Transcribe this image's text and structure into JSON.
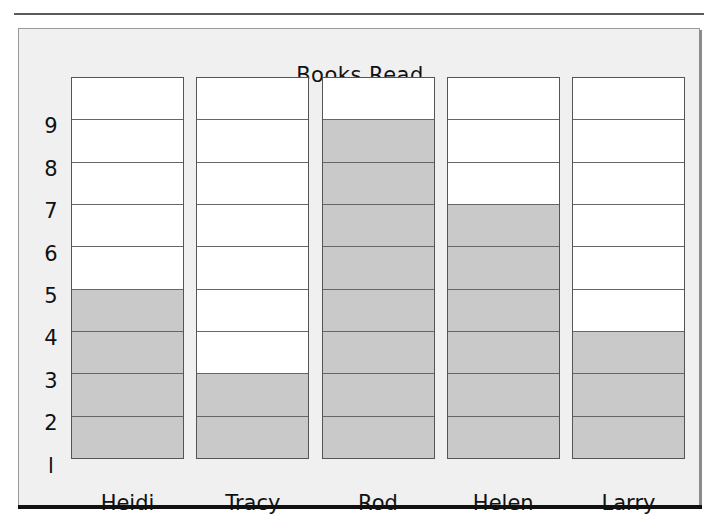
{
  "chart_data": {
    "type": "bar",
    "title": "Books Read",
    "subtitle": "",
    "xlabel": "",
    "ylabel": "",
    "categories": [
      "Heidi",
      "Tracy",
      "Rod",
      "Helen",
      "Larry"
    ],
    "values": [
      4,
      2,
      8,
      6,
      3
    ],
    "series": [
      {
        "name": "Books Read",
        "values": [
          4,
          2,
          8,
          6,
          3
        ]
      }
    ],
    "ylim": [
      0,
      9
    ],
    "ytick_labels": [
      "9",
      "8",
      "7",
      "6",
      "5",
      "4",
      "3",
      "2",
      "l"
    ],
    "ytick_values": [
      9,
      8,
      7,
      6,
      5,
      4,
      3,
      2,
      1
    ],
    "grid": true,
    "legend": false,
    "legend_position": "none",
    "style": "stacked-cell pictograph column chart",
    "filled_color": "#c9c9c9",
    "empty_color": "#ffffff",
    "cell_border_color": "#666666",
    "panel_background": "#f0f0f0",
    "text_color": "#111111"
  },
  "chart": {
    "title": "Books Read",
    "columns": [
      {
        "label": "Heidi",
        "value": 4
      },
      {
        "label": "Tracy",
        "value": 2
      },
      {
        "label": "Rod",
        "value": 8
      },
      {
        "label": "Helen",
        "value": 6
      },
      {
        "label": "Larry",
        "value": 3
      }
    ],
    "y_ticks": [
      "9",
      "8",
      "7",
      "6",
      "5",
      "4",
      "3",
      "2",
      "l"
    ],
    "max": 9
  }
}
